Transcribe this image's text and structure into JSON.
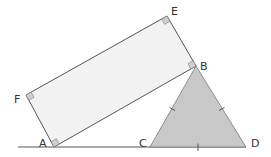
{
  "diagram": {
    "type": "geometry",
    "colors": {
      "line": "#555555",
      "rectangle_fill": "#f2f2f2",
      "triangle_fill": "#c8c8c8",
      "marker_fill": "#cfcfcf",
      "label": "#333333"
    },
    "points": {
      "A": {
        "label": "A",
        "x": 54,
        "y": 147
      },
      "B": {
        "label": "B",
        "x": 196,
        "y": 66
      },
      "C": {
        "label": "C",
        "x": 150,
        "y": 147
      },
      "D": {
        "label": "D",
        "x": 246,
        "y": 147
      },
      "E": {
        "label": "E",
        "x": 167,
        "y": 16
      },
      "F": {
        "label": "F",
        "x": 26,
        "y": 95
      }
    },
    "shapes": {
      "rectangle": {
        "name": "ABEF",
        "vertices": [
          "A",
          "B",
          "E",
          "F"
        ],
        "right_angles": [
          "A",
          "B",
          "E",
          "F"
        ]
      },
      "triangle": {
        "name": "BCD",
        "vertices": [
          "B",
          "C",
          "D"
        ],
        "equal_sides_marked": [
          "BC",
          "BD",
          "CD"
        ]
      }
    },
    "baseline": {
      "from_x": 18,
      "to_x": 246,
      "y": 147
    }
  }
}
